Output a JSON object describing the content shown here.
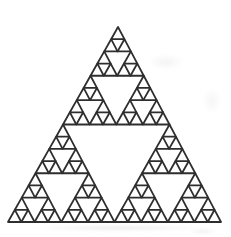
{
  "figure": {
    "name": "sierpinski-triangle",
    "kind": "fractal-line-drawing",
    "recursion_depth": 4,
    "smallest_triangle_count": 81,
    "canvas": {
      "width": 231,
      "height": 237
    },
    "vertices": {
      "apex": [
        118,
        27
      ],
      "bottom_left": [
        8,
        222
      ],
      "bottom_right": [
        221,
        222
      ]
    },
    "style": {
      "stroke_color": "#2e2e2e",
      "stroke_width": 1.8,
      "background_color": "#ffffff",
      "smudge_color": "#bdbdbd"
    },
    "smudges": [
      {
        "left": 148,
        "top": 54,
        "width": 36,
        "height": 16,
        "opacity": 0.18
      },
      {
        "left": 203,
        "top": 88,
        "width": 18,
        "height": 26,
        "opacity": 0.15
      },
      {
        "left": 28,
        "top": 225,
        "width": 182,
        "height": 6,
        "opacity": 0.35
      },
      {
        "left": 188,
        "top": 228,
        "width": 30,
        "height": 7,
        "opacity": 0.22
      }
    ]
  }
}
